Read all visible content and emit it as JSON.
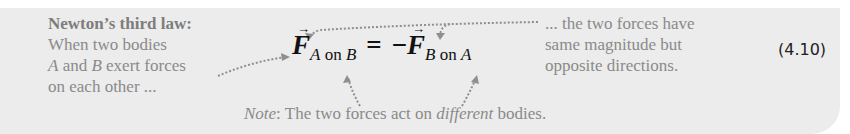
{
  "law_box": {
    "title": "Newton’s third law:",
    "left_text": {
      "line1": "When two bodies",
      "line2_a": "A",
      "line2_b": " and ",
      "line2_c": "B",
      "line2_d": " exert forces",
      "line3": "on each other ..."
    },
    "equation": {
      "lhs_symbol": "F",
      "lhs_sub_1": "A",
      "lhs_sub_2": " on ",
      "lhs_sub_3": "B",
      "equals": "=",
      "minus": "−",
      "rhs_symbol": "F",
      "rhs_sub_1": "B",
      "rhs_sub_2": " on ",
      "rhs_sub_3": "A"
    },
    "right_text": {
      "line1": "... the two forces have",
      "line2": "same magnitude but",
      "line3": "opposite directions."
    },
    "note": {
      "label": "Note",
      "colon": ":  The two forces act on ",
      "emph": "different",
      "tail": " bodies."
    },
    "equation_number": "(4.10)"
  }
}
